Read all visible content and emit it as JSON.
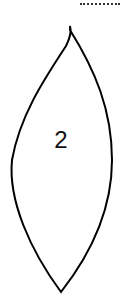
{
  "diagram": {
    "shape": "leaf",
    "label": "2",
    "stroke_color": "#000000",
    "background": "#ffffff"
  }
}
